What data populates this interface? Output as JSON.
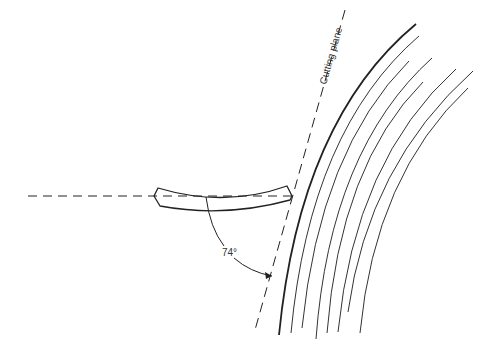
{
  "diagram": {
    "type": "technical-line-drawing",
    "labels": {
      "cutting_plane": "Cutting plane",
      "angle": "74°"
    },
    "elements": [
      "horizontal-dashed-axis",
      "gouge-tool",
      "cutting-plane-dashed-line",
      "angle-arc-with-arrow",
      "log-surface-curve",
      "growth-ring-curves"
    ],
    "colors": {
      "stroke": "#222222",
      "background": "#ffffff"
    }
  }
}
